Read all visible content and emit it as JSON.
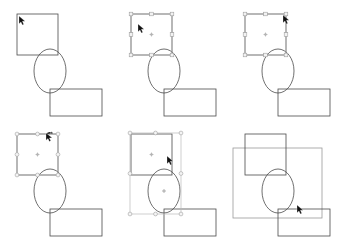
{
  "app": {
    "title": "Vector shape selection states",
    "background_color": "#ffffff",
    "canvas_width": 342,
    "canvas_height": 240,
    "stroke_color": "#4a4a4a",
    "dim_stroke_color": "#8c8c8c",
    "selection_box_color": "#b9b9b9",
    "handle_fill_color": "#f2f2f2",
    "handle_stroke_color": "#9a9a9a",
    "marquee_color": "#9a9a9a",
    "cursor_color": "#111111"
  },
  "grid": {
    "columns": 3,
    "rows": 2,
    "panel_width": 114,
    "panel_height": 120
  },
  "shapes": {
    "square": {
      "name": "square",
      "x": 17,
      "y": 14,
      "width": 41,
      "height": 41
    },
    "ellipse": {
      "name": "ellipse",
      "cx": 50,
      "cy": 71,
      "rx": 16,
      "ry": 22
    },
    "rectangle": {
      "name": "rectangle",
      "x": 50,
      "y": 89,
      "width": 52,
      "height": 27
    }
  },
  "panels": [
    {
      "id": "panel-1",
      "index": 1,
      "label": "No selection",
      "state": "idle",
      "selection": "none",
      "cursor": {
        "type": "arrow-pointer",
        "x": 19,
        "y": 16
      }
    },
    {
      "id": "panel-2",
      "index": 2,
      "label": "Square selected with scale handles",
      "state": "selected-scale",
      "selection": "square",
      "handle_shape": "square",
      "handle_count": 8,
      "pivot_visible": true,
      "cursor": {
        "type": "arrow-pointer",
        "x": 24,
        "y": 24
      }
    },
    {
      "id": "panel-3",
      "index": 3,
      "label": "Square selected, cursor on corner handle",
      "state": "selected-scale",
      "selection": "square",
      "handle_shape": "square",
      "handle_count": 8,
      "pivot_visible": true,
      "cursor": {
        "type": "arrow-pointer",
        "x": 55,
        "y": 15
      }
    },
    {
      "id": "panel-4",
      "index": 4,
      "label": "Square selected with rotate handles",
      "state": "selected-rotate",
      "selection": "square",
      "handle_shape": "circle",
      "handle_count": 8,
      "pivot_visible": true,
      "cursor": {
        "type": "rotate-pointer",
        "x": 46,
        "y": 12
      }
    },
    {
      "id": "panel-5",
      "index": 5,
      "label": "Square and ellipse multi-selected",
      "state": "multi-selected",
      "selection": "square+ellipse",
      "handle_shape": "circle",
      "handle_count": 8,
      "pivot_visible": true,
      "cursor": {
        "type": "arrow-pointer",
        "x": 53,
        "y": 36
      }
    },
    {
      "id": "panel-6",
      "index": 6,
      "label": "Rubber band marquee selection drag",
      "state": "marquee-drag",
      "selection": "marquee",
      "marquee": {
        "x": 5,
        "y": 28,
        "width": 89,
        "height": 70
      },
      "cursor": {
        "type": "arrow-pointer",
        "x": 69,
        "y": 85
      }
    }
  ]
}
